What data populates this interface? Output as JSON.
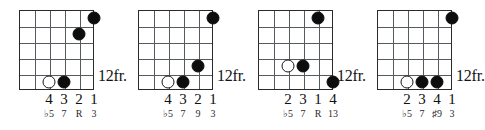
{
  "page": {
    "type": "guitar-chord-diagram-row",
    "diagram_count": 4,
    "strings": 6,
    "frets": 5,
    "colors": {
      "ink": "#101010",
      "grid_line": "#555a5e",
      "border": "#2a2a2a",
      "paper": "#ffffff"
    }
  },
  "top_bleed": {
    "marks": [
      "♪",
      "♪",
      "♪",
      "♪"
    ],
    "x_positions": [
      60,
      178,
      298,
      417
    ]
  },
  "diagrams": [
    {
      "id": "chord-1",
      "left": 0,
      "fret_label": "12fr.",
      "dots": [
        {
          "string": 1,
          "fret": 1,
          "type": "filled"
        },
        {
          "string": 2,
          "fret": 2,
          "type": "filled"
        },
        {
          "string": 3,
          "fret": 5,
          "type": "filled"
        },
        {
          "string": 4,
          "fret": 5,
          "type": "open"
        }
      ],
      "fingers": [
        "4",
        "3",
        "2",
        "1"
      ],
      "intervals": [
        "♭5",
        "7",
        "R",
        "3"
      ],
      "label_strings": [
        4,
        3,
        2,
        1
      ]
    },
    {
      "id": "chord-2",
      "left": 119,
      "fret_label": "12fr.",
      "dots": [
        {
          "string": 1,
          "fret": 1,
          "type": "filled"
        },
        {
          "string": 2,
          "fret": 4,
          "type": "filled"
        },
        {
          "string": 3,
          "fret": 5,
          "type": "filled"
        },
        {
          "string": 4,
          "fret": 5,
          "type": "open"
        }
      ],
      "fingers": [
        "4",
        "3",
        "2",
        "1"
      ],
      "intervals": [
        "♭5",
        "7",
        "9",
        "3"
      ],
      "label_strings": [
        4,
        3,
        2,
        1
      ]
    },
    {
      "id": "chord-3",
      "left": 239,
      "fret_label": "12fr.",
      "dots": [
        {
          "string": 2,
          "fret": 1,
          "type": "filled"
        },
        {
          "string": 3,
          "fret": 4,
          "type": "filled"
        },
        {
          "string": 4,
          "fret": 4,
          "type": "open"
        },
        {
          "string": 1,
          "fret": 5,
          "type": "filled"
        }
      ],
      "fingers": [
        "2",
        "3",
        "1",
        "4"
      ],
      "intervals": [
        "♭5",
        "7",
        "R",
        "13"
      ],
      "label_strings": [
        4,
        3,
        2,
        1
      ]
    },
    {
      "id": "chord-4",
      "left": 358,
      "fret_label": "12fr.",
      "dots": [
        {
          "string": 1,
          "fret": 1,
          "type": "filled"
        },
        {
          "string": 2,
          "fret": 5,
          "type": "filled"
        },
        {
          "string": 3,
          "fret": 5,
          "type": "filled"
        },
        {
          "string": 4,
          "fret": 5,
          "type": "open"
        }
      ],
      "fingers": [
        "2",
        "3",
        "4",
        "1"
      ],
      "intervals": [
        "♭5",
        "7",
        "♯9",
        "3"
      ],
      "label_strings": [
        4,
        3,
        2,
        1
      ]
    }
  ]
}
